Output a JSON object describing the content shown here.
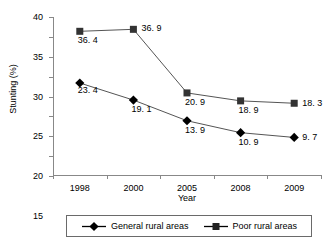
{
  "chart_data": {
    "type": "line",
    "title": "",
    "xlabel": "Year",
    "ylabel": "Stunting (%)",
    "categories": [
      "1998",
      "2000",
      "2005",
      "2008",
      "2009"
    ],
    "ylim": [
      0,
      40
    ],
    "yticks": [
      "0",
      "5",
      "10",
      "15",
      "20",
      "25",
      "30",
      "35",
      "40"
    ],
    "grid": false,
    "legend_position": "bottom",
    "series": [
      {
        "name": "General rural areas",
        "marker": "diamond",
        "color": "#000000",
        "values": [
          23.4,
          19.1,
          13.9,
          10.9,
          9.7
        ],
        "labels": [
          "23. 4",
          "19. 1",
          "13. 9",
          "10. 9",
          "9. 7"
        ]
      },
      {
        "name": "Poor rural areas",
        "marker": "square",
        "color": "#333333",
        "values": [
          36.4,
          36.9,
          20.9,
          18.9,
          18.3
        ],
        "labels": [
          "36. 4",
          "36. 9",
          "20. 9",
          "18. 9",
          "18. 3"
        ]
      }
    ]
  },
  "axes": {
    "y_title": "Stunting (%)",
    "x_title": "Year"
  },
  "legend": {
    "items": [
      {
        "label": "General rural areas",
        "marker": "diamond-marker-icon"
      },
      {
        "label": "Poor rural areas",
        "marker": "square-marker-icon"
      }
    ]
  }
}
